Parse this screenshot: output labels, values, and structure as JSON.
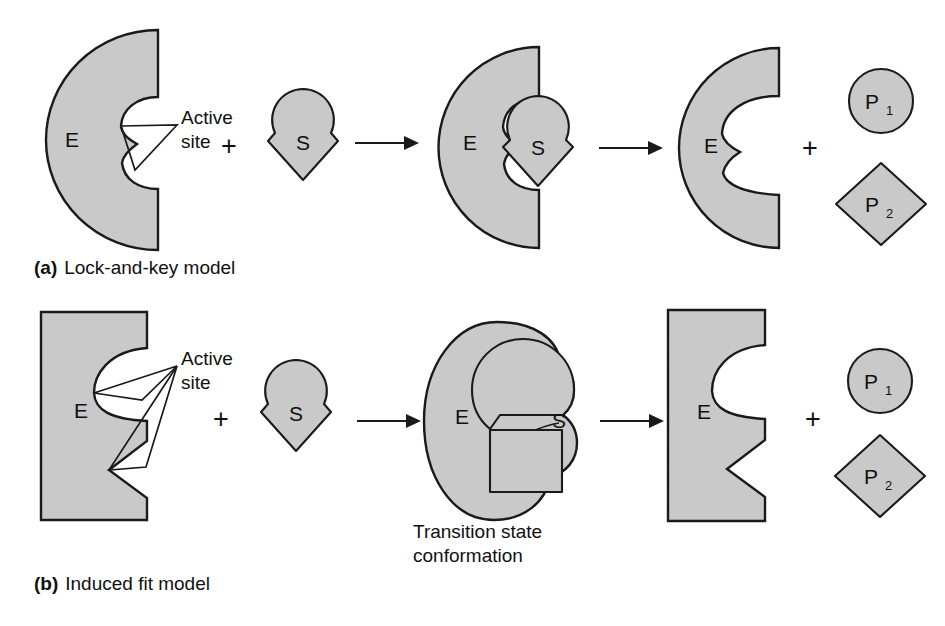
{
  "figure": {
    "background_color": "#ffffff",
    "shape_fill_color": "#c9c9c9",
    "shape_stroke_color": "#1a1a1a",
    "text_color": "#101010"
  },
  "panels": [
    {
      "id": "a",
      "marker": "(a)",
      "caption": "Lock-and-key model",
      "annotation": {
        "line1": "Active",
        "line2": "site"
      },
      "steps": [
        {
          "name": "free-enzyme",
          "label": "E",
          "shape": "half-disc-with-keyhole-notch"
        },
        {
          "name": "operator-plus",
          "label": "+"
        },
        {
          "name": "substrate",
          "label": "S",
          "shape": "circle-over-diamond"
        },
        {
          "name": "reaction-arrow-1",
          "label": "→"
        },
        {
          "name": "enzyme-substrate-complex",
          "enzyme_label": "E",
          "substrate_label": "S",
          "shape": "half-disc-with-substrate-bound"
        },
        {
          "name": "reaction-arrow-2",
          "label": "→"
        },
        {
          "name": "released-enzyme",
          "label": "E",
          "shape": "half-disc-with-wide-notch"
        },
        {
          "name": "operator-plus-2",
          "label": "+"
        },
        {
          "name": "product-1",
          "label": "P",
          "subscript": "1",
          "shape": "circle"
        },
        {
          "name": "product-2",
          "label": "P",
          "subscript": "2",
          "shape": "diamond"
        }
      ]
    },
    {
      "id": "b",
      "marker": "(b)",
      "caption": "Induced fit model",
      "annotation": {
        "line1": "Active",
        "line2": "site"
      },
      "transition_label": {
        "line1": "Transition state",
        "line2": "conformation"
      },
      "steps": [
        {
          "name": "free-enzyme",
          "label": "E",
          "shape": "rectangle-with-round-bite-and-v-notch"
        },
        {
          "name": "operator-plus",
          "label": "+"
        },
        {
          "name": "substrate",
          "label": "S",
          "shape": "circle-over-diamond"
        },
        {
          "name": "reaction-arrow-1",
          "label": "→"
        },
        {
          "name": "transition-state-complex",
          "enzyme_label": "E",
          "substrate_label": "S",
          "shape": "blob-enclosing-circle-and-square"
        },
        {
          "name": "reaction-arrow-2",
          "label": "→"
        },
        {
          "name": "released-enzyme",
          "label": "E",
          "shape": "rectangle-with-round-bite-and-v-notch"
        },
        {
          "name": "operator-plus-2",
          "label": "+"
        },
        {
          "name": "product-1",
          "label": "P",
          "subscript": "1",
          "shape": "circle"
        },
        {
          "name": "product-2",
          "label": "P",
          "subscript": "2",
          "shape": "diamond"
        }
      ]
    }
  ]
}
